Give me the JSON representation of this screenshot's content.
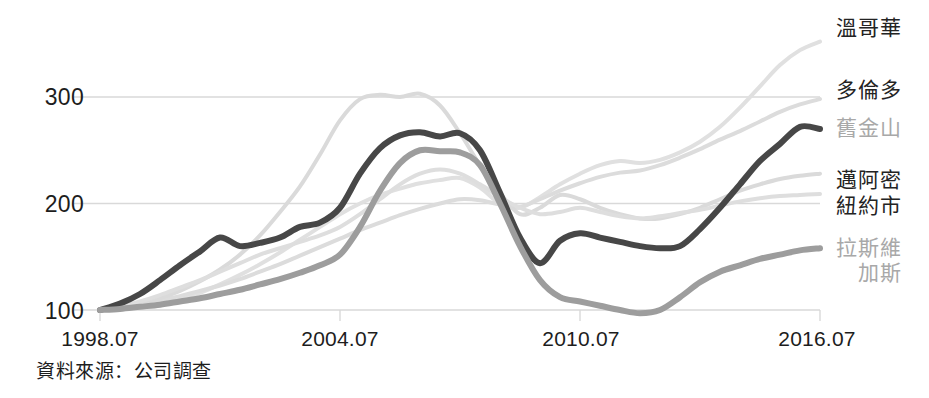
{
  "chart_data": {
    "type": "line",
    "title": "",
    "subtitle": "",
    "xlabel": "",
    "ylabel": "",
    "source_note": "資料來源：公司調查",
    "grid": true,
    "legend_position": "right-end-of-line",
    "xlim": [
      1998.5,
      2016.5
    ],
    "ylim": [
      85,
      360
    ],
    "yticks": [
      100,
      200,
      300
    ],
    "ytick_labels": [
      "100",
      "200",
      "300"
    ],
    "xticks": [
      1998.5,
      2004.5,
      2010.5,
      2016.5
    ],
    "xtick_labels": [
      "1998.07",
      "2004.07",
      "2010.07",
      "2016.07"
    ],
    "x": [
      1998.5,
      1999.0,
      1999.5,
      2000.0,
      2000.5,
      2001.0,
      2001.5,
      2002.0,
      2002.5,
      2003.0,
      2003.5,
      2004.0,
      2004.5,
      2005.0,
      2005.5,
      2006.0,
      2006.5,
      2007.0,
      2007.5,
      2008.0,
      2008.5,
      2009.0,
      2009.5,
      2010.0,
      2010.5,
      2011.0,
      2011.5,
      2012.0,
      2012.5,
      2013.0,
      2013.5,
      2014.0,
      2014.5,
      2015.0,
      2015.5,
      2016.0,
      2016.5
    ],
    "series": [
      {
        "name": "溫哥華",
        "name_en": "Vancouver",
        "color": "#e0e0e0",
        "width": 4,
        "label_value": 352,
        "values": [
          100,
          101,
          103,
          106,
          110,
          116,
          124,
          133,
          143,
          154,
          166,
          178,
          190,
          200,
          208,
          214,
          219,
          222,
          224,
          215,
          200,
          196,
          206,
          218,
          228,
          236,
          240,
          238,
          241,
          248,
          258,
          272,
          290,
          310,
          330,
          344,
          352
        ]
      },
      {
        "name": "多倫多",
        "name_en": "Toronto",
        "color": "#dcdcdc",
        "width": 4,
        "label_value": 298,
        "values": [
          100,
          102,
          105,
          109,
          113,
          118,
          123,
          129,
          136,
          143,
          151,
          159,
          167,
          175,
          182,
          189,
          195,
          200,
          204,
          203,
          199,
          197,
          204,
          212,
          219,
          225,
          229,
          231,
          236,
          243,
          251,
          260,
          268,
          277,
          286,
          293,
          298
        ]
      },
      {
        "name": "舊金山",
        "name_en": "San Francisco",
        "color": "#474747",
        "width": 6,
        "label_value": 270,
        "values": [
          100,
          106,
          115,
          128,
          142,
          155,
          168,
          160,
          163,
          168,
          178,
          182,
          196,
          228,
          252,
          264,
          267,
          263,
          266,
          250,
          210,
          168,
          144,
          165,
          172,
          168,
          164,
          160,
          158,
          160,
          176,
          196,
          218,
          240,
          256,
          272,
          270
        ]
      },
      {
        "name": "邁阿密",
        "name_en": "Miami",
        "color": "#dadada",
        "width": 4,
        "label_value": 228,
        "values": [
          100,
          102,
          106,
          111,
          118,
          127,
          138,
          152,
          170,
          192,
          216,
          246,
          278,
          298,
          302,
          300,
          303,
          292,
          266,
          236,
          210,
          190,
          196,
          208,
          204,
          196,
          190,
          186,
          186,
          190,
          196,
          204,
          212,
          218,
          223,
          226,
          228
        ]
      },
      {
        "name": "紐約市",
        "name_en": "New York City",
        "color": "#dedede",
        "width": 4,
        "label_value": 209,
        "values": [
          100,
          103,
          108,
          114,
          121,
          128,
          136,
          144,
          152,
          158,
          164,
          170,
          178,
          190,
          204,
          218,
          228,
          232,
          228,
          218,
          206,
          196,
          190,
          192,
          196,
          192,
          188,
          186,
          188,
          191,
          194,
          198,
          202,
          205,
          207,
          208,
          209
        ]
      },
      {
        "name": "拉斯維加斯",
        "name_en": "Las Vegas",
        "color": "#9d9d9d",
        "width": 6,
        "label_value": 158,
        "values": [
          100,
          101,
          103,
          105,
          108,
          111,
          115,
          119,
          124,
          129,
          135,
          142,
          152,
          178,
          212,
          238,
          250,
          249,
          248,
          236,
          200,
          160,
          128,
          112,
          108,
          104,
          100,
          97,
          100,
          112,
          126,
          136,
          142,
          148,
          152,
          156,
          158
        ]
      }
    ]
  },
  "axis": {
    "y_tick_300": "300",
    "y_tick_200": "200",
    "y_tick_100": "100",
    "x_tick_1": "1998.07",
    "x_tick_2": "2004.07",
    "x_tick_3": "2010.07",
    "x_tick_4": "2016.07"
  },
  "legend": {
    "vancouver": "溫哥華",
    "toronto": "多倫多",
    "san_francisco": "舊金山",
    "miami": "邁阿密",
    "new_york": "紐約市",
    "las_vegas_line1": "拉斯維",
    "las_vegas_line2": "加斯"
  },
  "footer": {
    "source": "資料來源：公司調查"
  },
  "colors": {
    "dark_line": "#474747",
    "medium_line": "#9d9d9d",
    "light_line": "#dcdcdc",
    "grid": "#d9d9d9",
    "text": "#1d1d1d",
    "dim_text": "#a8a8a8",
    "background": "#ffffff"
  }
}
